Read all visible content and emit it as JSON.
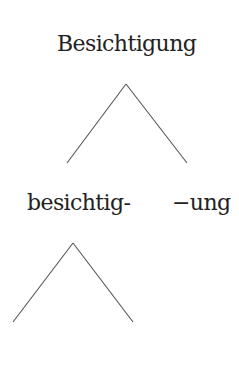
{
  "diagram": {
    "type": "morphological-tree",
    "line_color": "#555555",
    "text_color": "#222222",
    "root": {
      "label": "Besichtigung",
      "branch": {
        "apex": [
          126,
          84
        ],
        "left": [
          67,
          163
        ],
        "right": [
          187,
          163
        ]
      }
    },
    "children": [
      {
        "label": "besichtig-",
        "branch": {
          "apex": [
            73,
            243
          ],
          "left": [
            13,
            322
          ],
          "right": [
            133,
            322
          ]
        }
      },
      {
        "label": "−ung"
      }
    ]
  }
}
